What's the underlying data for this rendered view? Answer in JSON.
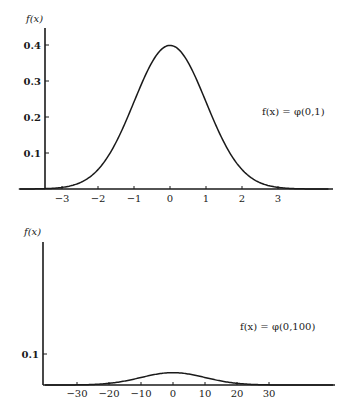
{
  "chart_data": [
    {
      "type": "line",
      "title": "",
      "ylabel": "f(x)",
      "xlabel": "",
      "annotation": "f(x) = φ(0,1)",
      "x_ticks": [
        -3,
        -2,
        -1,
        0,
        1,
        2,
        3
      ],
      "x_tick_labels": [
        "−3",
        "−2",
        "−1",
        "0",
        "1",
        "2",
        "3"
      ],
      "y_ticks": [
        0.1,
        0.2,
        0.3,
        0.4
      ],
      "y_tick_labels": [
        "0.1",
        "0.2",
        "0.3",
        "0.4"
      ],
      "xlim": [
        -4.5,
        4.5
      ],
      "ylim": [
        0,
        0.45
      ],
      "grid": false,
      "series": [
        {
          "name": "φ(0,1)",
          "mean": 0,
          "variance": 1,
          "x": [
            -4,
            -3,
            -2,
            -1,
            0,
            1,
            2,
            3,
            4
          ],
          "values": [
            0.0001,
            0.0044,
            0.054,
            0.242,
            0.399,
            0.242,
            0.054,
            0.0044,
            0.0001
          ]
        }
      ]
    },
    {
      "type": "line",
      "title": "",
      "ylabel": "f(x)",
      "xlabel": "",
      "annotation": "f(x) = φ(0,100)",
      "x_ticks": [
        -30,
        -20,
        -10,
        0,
        10,
        20,
        30
      ],
      "x_tick_labels": [
        "−30",
        "−20",
        "−10",
        "0",
        "10",
        "20",
        "30"
      ],
      "y_ticks": [
        0.1
      ],
      "y_tick_labels": [
        "0.1"
      ],
      "xlim": [
        -40,
        50
      ],
      "ylim": [
        0,
        0.45
      ],
      "grid": false,
      "series": [
        {
          "name": "φ(0,100)",
          "mean": 0,
          "variance": 100,
          "x": [
            -40,
            -30,
            -20,
            -10,
            0,
            10,
            20,
            30,
            40
          ],
          "values": [
            1e-05,
            0.0004,
            0.0054,
            0.0242,
            0.0399,
            0.0242,
            0.0054,
            0.0004,
            1e-05
          ]
        }
      ]
    }
  ],
  "labels": {
    "top_ylabel": "f(x)",
    "top_annotation": "f(x) = φ(0,1)",
    "bottom_ylabel": "f(x)",
    "bottom_annotation": "f(x) = φ(0,100)"
  }
}
